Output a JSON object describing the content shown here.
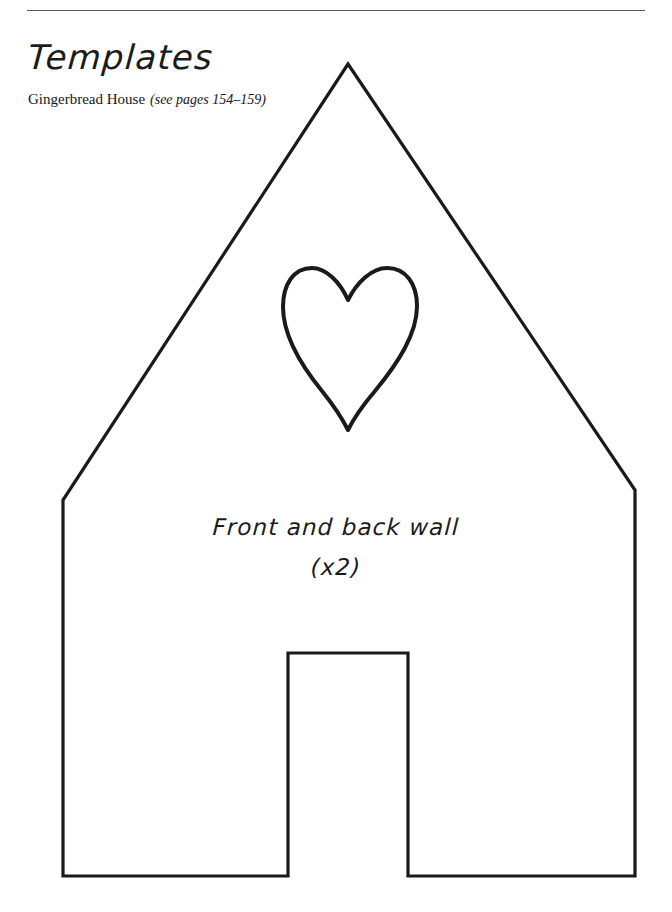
{
  "page": {
    "background_color": "#ffffff",
    "ink_color": "#1a1a1a",
    "rule_color": "#5a5a5a"
  },
  "header": {
    "title": "Templates",
    "subtitle_main": "Gingerbread House",
    "subtitle_paren": "(see pages 154–159)"
  },
  "template": {
    "piece_label": "Front and back wall",
    "quantity_label": "(x2)",
    "shapes": {
      "house_outline": "house-outline",
      "heart_cutout": "heart-cutout",
      "door_cutout": "door-cutout"
    }
  }
}
